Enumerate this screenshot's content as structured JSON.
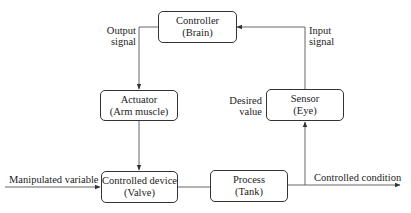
{
  "diagram": {
    "type": "control-loop block diagram",
    "blocks": [
      {
        "id": "controller",
        "title": "Controller",
        "subtitle": "(Brain)"
      },
      {
        "id": "actuator",
        "title": "Actuator",
        "subtitle": "(Arm muscle)"
      },
      {
        "id": "sensor",
        "title": "Sensor",
        "subtitle": "(Eye)"
      },
      {
        "id": "controlled_device",
        "title": "Controlled device",
        "subtitle": "(Valve)"
      },
      {
        "id": "process",
        "title": "Process",
        "subtitle": "(Tank)"
      }
    ],
    "labels": {
      "output_signal": [
        "Output",
        "signal"
      ],
      "input_signal": [
        "Input",
        "signal"
      ],
      "desired_value": [
        "Desired",
        "value"
      ],
      "manipulated_variable": "Manipulated variable",
      "controlled_condition": "Controlled condition"
    },
    "connections": [
      {
        "from": "controller",
        "to": "actuator",
        "label": "Output signal"
      },
      {
        "from": "actuator",
        "to": "controlled_device"
      },
      {
        "from": "input",
        "to": "controlled_device",
        "label": "Manipulated variable"
      },
      {
        "from": "controlled_device",
        "to": "process"
      },
      {
        "from": "process",
        "to": "output",
        "label": "Controlled condition"
      },
      {
        "from": "process_output",
        "to": "sensor"
      },
      {
        "from": "sensor",
        "to": "controller",
        "label": "Input signal"
      }
    ]
  }
}
